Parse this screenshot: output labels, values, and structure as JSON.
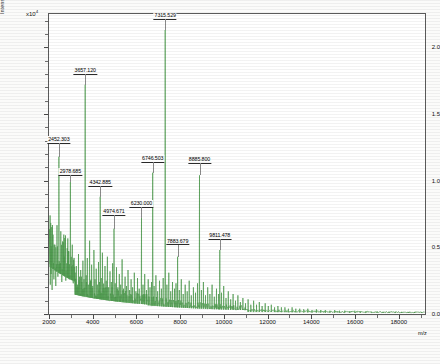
{
  "chart_data": {
    "type": "line",
    "title": "",
    "xlabel": "m/z",
    "ylabel": "Intens. [a.u.]",
    "y_exponent_label": "x10",
    "y_exponent_value": "4",
    "xlim": [
      2000,
      19200
    ],
    "ylim": [
      0,
      2.25
    ],
    "grid": false,
    "legend": null,
    "xticks": [
      2000,
      4000,
      6000,
      8000,
      10000,
      12000,
      14000,
      16000,
      18000
    ],
    "xtick_labels": [
      "2000",
      "4000",
      "6000",
      "8000",
      "10000",
      "12000",
      "14000",
      "16000",
      "18000"
    ],
    "yticks": [
      0.0,
      0.5,
      1.0,
      1.5,
      2.0
    ],
    "ytick_labels": [
      "0.0",
      "0.5",
      "1.0",
      "1.5",
      "2.0"
    ],
    "series_name": "MALDI-TOF mass spectrum",
    "trace_color": "#4e9a4e",
    "annotations": [
      {
        "label": "2452.303",
        "mz": 2452.303,
        "intensity": 1.18,
        "label_y": 1.28
      },
      {
        "label": "2978.685",
        "mz": 2978.685,
        "intensity": 0.99,
        "label_y": 1.04
      },
      {
        "label": "3657.120",
        "mz": 3657.12,
        "intensity": 1.72,
        "label_y": 1.8
      },
      {
        "label": "4342.885",
        "mz": 4342.885,
        "intensity": 0.88,
        "label_y": 0.96
      },
      {
        "label": "4974.671",
        "mz": 4974.671,
        "intensity": 0.64,
        "label_y": 0.74
      },
      {
        "label": "6230.000",
        "mz": 6230.0,
        "intensity": 0.72,
        "label_y": 0.8
      },
      {
        "label": "6746.503",
        "mz": 6746.503,
        "intensity": 1.06,
        "label_y": 1.14
      },
      {
        "label": "7315.529",
        "mz": 7315.529,
        "intensity": 2.13,
        "label_y": 2.21
      },
      {
        "label": "7883.679",
        "mz": 7883.679,
        "intensity": 0.43,
        "label_y": 0.52
      },
      {
        "label": "8885.800",
        "mz": 8885.8,
        "intensity": 1.04,
        "label_y": 1.13
      },
      {
        "label": "9811.478",
        "mz": 9811.478,
        "intensity": 0.48,
        "label_y": 0.56
      }
    ],
    "peaks": [
      {
        "mz": 2060,
        "intensity": 0.22
      },
      {
        "mz": 2098,
        "intensity": 0.3
      },
      {
        "mz": 2140,
        "intensity": 0.18
      },
      {
        "mz": 2185,
        "intensity": 0.41
      },
      {
        "mz": 2225,
        "intensity": 0.26
      },
      {
        "mz": 2270,
        "intensity": 0.52
      },
      {
        "mz": 2310,
        "intensity": 0.21
      },
      {
        "mz": 2360,
        "intensity": 0.35
      },
      {
        "mz": 2405,
        "intensity": 0.28
      },
      {
        "mz": 2452,
        "intensity": 1.18
      },
      {
        "mz": 2496,
        "intensity": 0.33
      },
      {
        "mz": 2540,
        "intensity": 0.62
      },
      {
        "mz": 2585,
        "intensity": 0.24
      },
      {
        "mz": 2630,
        "intensity": 0.44
      },
      {
        "mz": 2678,
        "intensity": 0.3
      },
      {
        "mz": 2722,
        "intensity": 0.57
      },
      {
        "mz": 2770,
        "intensity": 0.25
      },
      {
        "mz": 2815,
        "intensity": 0.38
      },
      {
        "mz": 2862,
        "intensity": 0.29
      },
      {
        "mz": 2905,
        "intensity": 0.47
      },
      {
        "mz": 2940,
        "intensity": 0.26
      },
      {
        "mz": 2978,
        "intensity": 0.99
      },
      {
        "mz": 3020,
        "intensity": 0.3
      },
      {
        "mz": 3065,
        "intensity": 0.52
      },
      {
        "mz": 3110,
        "intensity": 0.23
      },
      {
        "mz": 3155,
        "intensity": 0.41
      },
      {
        "mz": 3200,
        "intensity": 0.27
      },
      {
        "mz": 3250,
        "intensity": 0.36
      },
      {
        "mz": 3300,
        "intensity": 0.22
      },
      {
        "mz": 3350,
        "intensity": 0.45
      },
      {
        "mz": 3400,
        "intensity": 0.28
      },
      {
        "mz": 3450,
        "intensity": 0.33
      },
      {
        "mz": 3500,
        "intensity": 0.24
      },
      {
        "mz": 3550,
        "intensity": 0.4
      },
      {
        "mz": 3600,
        "intensity": 0.26
      },
      {
        "mz": 3657,
        "intensity": 1.72
      },
      {
        "mz": 3700,
        "intensity": 0.29
      },
      {
        "mz": 3750,
        "intensity": 0.42
      },
      {
        "mz": 3800,
        "intensity": 0.22
      },
      {
        "mz": 3855,
        "intensity": 0.55
      },
      {
        "mz": 3900,
        "intensity": 0.25
      },
      {
        "mz": 3950,
        "intensity": 0.37
      },
      {
        "mz": 4000,
        "intensity": 0.21
      },
      {
        "mz": 4055,
        "intensity": 0.48
      },
      {
        "mz": 4105,
        "intensity": 0.26
      },
      {
        "mz": 4160,
        "intensity": 0.34
      },
      {
        "mz": 4210,
        "intensity": 0.22
      },
      {
        "mz": 4265,
        "intensity": 0.39
      },
      {
        "mz": 4310,
        "intensity": 0.24
      },
      {
        "mz": 4342,
        "intensity": 0.88
      },
      {
        "mz": 4390,
        "intensity": 0.27
      },
      {
        "mz": 4445,
        "intensity": 0.46
      },
      {
        "mz": 4500,
        "intensity": 0.21
      },
      {
        "mz": 4560,
        "intensity": 0.36
      },
      {
        "mz": 4615,
        "intensity": 0.25
      },
      {
        "mz": 4670,
        "intensity": 0.43
      },
      {
        "mz": 4725,
        "intensity": 0.2
      },
      {
        "mz": 4790,
        "intensity": 0.32
      },
      {
        "mz": 4850,
        "intensity": 0.24
      },
      {
        "mz": 4910,
        "intensity": 0.38
      },
      {
        "mz": 4974,
        "intensity": 0.64
      },
      {
        "mz": 5030,
        "intensity": 0.23
      },
      {
        "mz": 5090,
        "intensity": 0.35
      },
      {
        "mz": 5150,
        "intensity": 0.2
      },
      {
        "mz": 5215,
        "intensity": 0.3
      },
      {
        "mz": 5280,
        "intensity": 0.22
      },
      {
        "mz": 5345,
        "intensity": 0.41
      },
      {
        "mz": 5410,
        "intensity": 0.19
      },
      {
        "mz": 5480,
        "intensity": 0.28
      },
      {
        "mz": 5545,
        "intensity": 0.21
      },
      {
        "mz": 5615,
        "intensity": 0.33
      },
      {
        "mz": 5685,
        "intensity": 0.18
      },
      {
        "mz": 5755,
        "intensity": 0.26
      },
      {
        "mz": 5825,
        "intensity": 0.2
      },
      {
        "mz": 5900,
        "intensity": 0.31
      },
      {
        "mz": 5975,
        "intensity": 0.17
      },
      {
        "mz": 6050,
        "intensity": 0.27
      },
      {
        "mz": 6125,
        "intensity": 0.19
      },
      {
        "mz": 6230,
        "intensity": 0.72
      },
      {
        "mz": 6300,
        "intensity": 0.22
      },
      {
        "mz": 6380,
        "intensity": 0.3
      },
      {
        "mz": 6460,
        "intensity": 0.18
      },
      {
        "mz": 6540,
        "intensity": 0.26
      },
      {
        "mz": 6620,
        "intensity": 0.2
      },
      {
        "mz": 6690,
        "intensity": 0.24
      },
      {
        "mz": 6746,
        "intensity": 1.06
      },
      {
        "mz": 6810,
        "intensity": 0.21
      },
      {
        "mz": 6890,
        "intensity": 0.29
      },
      {
        "mz": 6970,
        "intensity": 0.17
      },
      {
        "mz": 7055,
        "intensity": 0.25
      },
      {
        "mz": 7140,
        "intensity": 0.19
      },
      {
        "mz": 7225,
        "intensity": 0.27
      },
      {
        "mz": 7315,
        "intensity": 2.13
      },
      {
        "mz": 7395,
        "intensity": 0.22
      },
      {
        "mz": 7480,
        "intensity": 0.31
      },
      {
        "mz": 7565,
        "intensity": 0.17
      },
      {
        "mz": 7650,
        "intensity": 0.24
      },
      {
        "mz": 7740,
        "intensity": 0.19
      },
      {
        "mz": 7810,
        "intensity": 0.23
      },
      {
        "mz": 7883,
        "intensity": 0.43
      },
      {
        "mz": 7960,
        "intensity": 0.18
      },
      {
        "mz": 8050,
        "intensity": 0.26
      },
      {
        "mz": 8140,
        "intensity": 0.15
      },
      {
        "mz": 8230,
        "intensity": 0.22
      },
      {
        "mz": 8320,
        "intensity": 0.17
      },
      {
        "mz": 8415,
        "intensity": 0.25
      },
      {
        "mz": 8510,
        "intensity": 0.14
      },
      {
        "mz": 8605,
        "intensity": 0.2
      },
      {
        "mz": 8700,
        "intensity": 0.16
      },
      {
        "mz": 8795,
        "intensity": 0.23
      },
      {
        "mz": 8885,
        "intensity": 1.04
      },
      {
        "mz": 8970,
        "intensity": 0.18
      },
      {
        "mz": 9065,
        "intensity": 0.24
      },
      {
        "mz": 9160,
        "intensity": 0.14
      },
      {
        "mz": 9260,
        "intensity": 0.2
      },
      {
        "mz": 9360,
        "intensity": 0.15
      },
      {
        "mz": 9460,
        "intensity": 0.22
      },
      {
        "mz": 9560,
        "intensity": 0.13
      },
      {
        "mz": 9660,
        "intensity": 0.19
      },
      {
        "mz": 9760,
        "intensity": 0.15
      },
      {
        "mz": 9811,
        "intensity": 0.48
      },
      {
        "mz": 9890,
        "intensity": 0.16
      },
      {
        "mz": 9990,
        "intensity": 0.21
      },
      {
        "mz": 10095,
        "intensity": 0.12
      },
      {
        "mz": 10200,
        "intensity": 0.17
      },
      {
        "mz": 10310,
        "intensity": 0.11
      },
      {
        "mz": 10420,
        "intensity": 0.15
      },
      {
        "mz": 10530,
        "intensity": 0.1
      },
      {
        "mz": 10640,
        "intensity": 0.14
      },
      {
        "mz": 10755,
        "intensity": 0.09
      },
      {
        "mz": 10870,
        "intensity": 0.12
      },
      {
        "mz": 10990,
        "intensity": 0.08
      },
      {
        "mz": 11110,
        "intensity": 0.11
      },
      {
        "mz": 11230,
        "intensity": 0.07
      },
      {
        "mz": 11360,
        "intensity": 0.1
      },
      {
        "mz": 11490,
        "intensity": 0.07
      },
      {
        "mz": 11620,
        "intensity": 0.09
      },
      {
        "mz": 11750,
        "intensity": 0.06
      },
      {
        "mz": 11890,
        "intensity": 0.08
      },
      {
        "mz": 12030,
        "intensity": 0.06
      },
      {
        "mz": 12170,
        "intensity": 0.07
      },
      {
        "mz": 12320,
        "intensity": 0.05
      },
      {
        "mz": 12470,
        "intensity": 0.06
      },
      {
        "mz": 12630,
        "intensity": 0.05
      },
      {
        "mz": 12790,
        "intensity": 0.05
      },
      {
        "mz": 12950,
        "intensity": 0.04
      },
      {
        "mz": 13120,
        "intensity": 0.05
      },
      {
        "mz": 13290,
        "intensity": 0.04
      },
      {
        "mz": 13470,
        "intensity": 0.04
      },
      {
        "mz": 13650,
        "intensity": 0.035
      },
      {
        "mz": 13840,
        "intensity": 0.04
      },
      {
        "mz": 14030,
        "intensity": 0.03
      },
      {
        "mz": 14230,
        "intensity": 0.035
      },
      {
        "mz": 14430,
        "intensity": 0.03
      },
      {
        "mz": 14640,
        "intensity": 0.03
      },
      {
        "mz": 14850,
        "intensity": 0.025
      },
      {
        "mz": 15070,
        "intensity": 0.03
      },
      {
        "mz": 15290,
        "intensity": 0.025
      },
      {
        "mz": 15520,
        "intensity": 0.025
      },
      {
        "mz": 15750,
        "intensity": 0.02
      },
      {
        "mz": 15990,
        "intensity": 0.025
      },
      {
        "mz": 16240,
        "intensity": 0.02
      },
      {
        "mz": 16490,
        "intensity": 0.02
      },
      {
        "mz": 16750,
        "intensity": 0.018
      },
      {
        "mz": 17010,
        "intensity": 0.02
      },
      {
        "mz": 17280,
        "intensity": 0.016
      },
      {
        "mz": 17560,
        "intensity": 0.018
      },
      {
        "mz": 17840,
        "intensity": 0.015
      },
      {
        "mz": 18130,
        "intensity": 0.016
      },
      {
        "mz": 18430,
        "intensity": 0.014
      },
      {
        "mz": 18730,
        "intensity": 0.015
      },
      {
        "mz": 19040,
        "intensity": 0.013
      }
    ]
  }
}
